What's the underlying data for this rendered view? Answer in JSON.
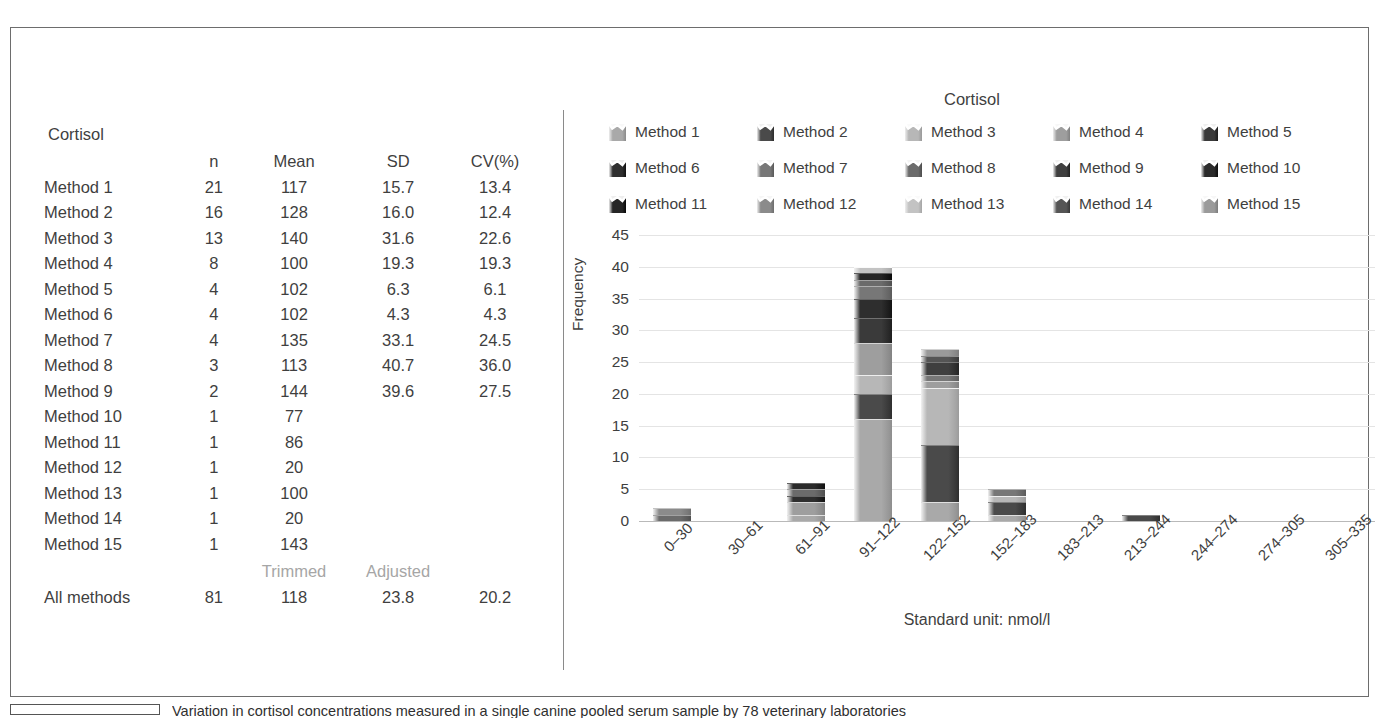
{
  "figure": {
    "caption": "Variation in cortisol concentrations measured in a single canine pooled serum sample by 78 veterinary laboratories"
  },
  "table": {
    "title": "Cortisol",
    "columns": [
      "",
      "n",
      "Mean",
      "SD",
      "CV(%)"
    ],
    "rows": [
      {
        "label": "Method 1",
        "n": "21",
        "mean": "117",
        "sd": "15.7",
        "cv": "13.4"
      },
      {
        "label": "Method 2",
        "n": "16",
        "mean": "128",
        "sd": "16.0",
        "cv": "12.4"
      },
      {
        "label": "Method 3",
        "n": "13",
        "mean": "140",
        "sd": "31.6",
        "cv": "22.6"
      },
      {
        "label": "Method 4",
        "n": "8",
        "mean": "100",
        "sd": "19.3",
        "cv": "19.3"
      },
      {
        "label": "Method 5",
        "n": "4",
        "mean": "102",
        "sd": "6.3",
        "cv": "6.1"
      },
      {
        "label": "Method 6",
        "n": "4",
        "mean": "102",
        "sd": "4.3",
        "cv": "4.3"
      },
      {
        "label": "Method 7",
        "n": "4",
        "mean": "135",
        "sd": "33.1",
        "cv": "24.5"
      },
      {
        "label": "Method 8",
        "n": "3",
        "mean": "113",
        "sd": "40.7",
        "cv": "36.0"
      },
      {
        "label": "Method 9",
        "n": "2",
        "mean": "144",
        "sd": "39.6",
        "cv": "27.5"
      },
      {
        "label": "Method 10",
        "n": "1",
        "mean": "77",
        "sd": "",
        "cv": ""
      },
      {
        "label": "Method 11",
        "n": "1",
        "mean": "86",
        "sd": "",
        "cv": ""
      },
      {
        "label": "Method 12",
        "n": "1",
        "mean": "20",
        "sd": "",
        "cv": ""
      },
      {
        "label": "Method 13",
        "n": "1",
        "mean": "100",
        "sd": "",
        "cv": ""
      },
      {
        "label": "Method 14",
        "n": "1",
        "mean": "20",
        "sd": "",
        "cv": ""
      },
      {
        "label": "Method 15",
        "n": "1",
        "mean": "143",
        "sd": "",
        "cv": ""
      }
    ],
    "sub_headers": {
      "mean": "Trimmed",
      "sd": "Adjusted"
    },
    "summary": {
      "label": "All methods",
      "n": "81",
      "mean": "118",
      "sd": "23.8",
      "cv": "20.2"
    }
  },
  "chart_data": {
    "type": "bar",
    "title": "Cortisol",
    "xlabel": "Standard unit: nmol/l",
    "ylabel": "Frequency",
    "ylim": [
      0,
      45
    ],
    "yticks": [
      0,
      5,
      10,
      15,
      20,
      25,
      30,
      35,
      40,
      45
    ],
    "grid": true,
    "stacked": true,
    "legend_position": "top",
    "categories": [
      "0–30",
      "30–61",
      "61–91",
      "91–122",
      "122–152",
      "152–183",
      "183–213",
      "213–244",
      "244–274",
      "274–305",
      "305–335"
    ],
    "totals": [
      2,
      0,
      6,
      40,
      27,
      5,
      0,
      1,
      0,
      0,
      0
    ],
    "series": [
      {
        "name": "Method 1",
        "color": "#a9a9a9",
        "values": [
          0,
          0,
          1,
          16,
          3,
          1,
          0,
          0,
          0,
          0,
          0
        ]
      },
      {
        "name": "Method 2",
        "color": "#4a4a4a",
        "values": [
          0,
          0,
          0,
          4,
          9,
          2,
          0,
          1,
          0,
          0,
          0
        ]
      },
      {
        "name": "Method 3",
        "color": "#b7b7b7",
        "values": [
          0,
          0,
          0,
          3,
          9,
          1,
          0,
          0,
          0,
          0,
          0
        ]
      },
      {
        "name": "Method 4",
        "color": "#9e9e9e",
        "values": [
          0,
          0,
          2,
          5,
          1,
          0,
          0,
          0,
          0,
          0,
          0
        ]
      },
      {
        "name": "Method 5",
        "color": "#3a3a3a",
        "values": [
          0,
          0,
          0,
          4,
          0,
          0,
          0,
          0,
          0,
          0,
          0
        ]
      },
      {
        "name": "Method 6",
        "color": "#2e2e2e",
        "values": [
          0,
          0,
          1,
          3,
          0,
          0,
          0,
          0,
          0,
          0,
          0
        ]
      },
      {
        "name": "Method 7",
        "color": "#777777",
        "values": [
          0,
          0,
          0,
          2,
          1,
          1,
          0,
          0,
          0,
          0,
          0
        ]
      },
      {
        "name": "Method 8",
        "color": "#6b6b6b",
        "values": [
          1,
          0,
          1,
          1,
          0,
          0,
          0,
          0,
          0,
          0,
          0
        ]
      },
      {
        "name": "Method 9",
        "color": "#3f3f3f",
        "values": [
          0,
          0,
          0,
          0,
          2,
          0,
          0,
          0,
          0,
          0,
          0
        ]
      },
      {
        "name": "Method 10",
        "color": "#2b2b2b",
        "values": [
          0,
          0,
          1,
          0,
          0,
          0,
          0,
          0,
          0,
          0,
          0
        ]
      },
      {
        "name": "Method 11",
        "color": "#252525",
        "values": [
          0,
          0,
          0,
          1,
          0,
          0,
          0,
          0,
          0,
          0,
          0
        ]
      },
      {
        "name": "Method 12",
        "color": "#8b8b8b",
        "values": [
          1,
          0,
          0,
          0,
          0,
          0,
          0,
          0,
          0,
          0,
          0
        ]
      },
      {
        "name": "Method 13",
        "color": "#c3c3c3",
        "values": [
          0,
          0,
          0,
          1,
          0,
          0,
          0,
          0,
          0,
          0,
          0
        ]
      },
      {
        "name": "Method 14",
        "color": "#555555",
        "values": [
          0,
          0,
          0,
          0,
          1,
          0,
          0,
          0,
          0,
          0,
          0
        ]
      },
      {
        "name": "Method 15",
        "color": "#9a9a9a",
        "values": [
          0,
          0,
          0,
          0,
          1,
          0,
          0,
          0,
          0,
          0,
          0
        ]
      }
    ]
  }
}
